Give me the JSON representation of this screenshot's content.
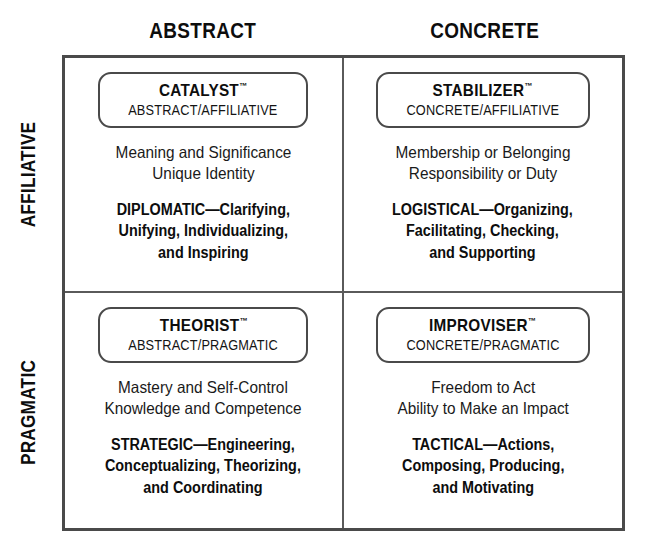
{
  "columns": [
    {
      "label": "ABSTRACT"
    },
    {
      "label": "CONCRETE"
    }
  ],
  "rows": [
    {
      "label": "AFFILIATIVE"
    },
    {
      "label": "PRAGMATIC"
    }
  ],
  "quadrants": [
    {
      "title": "CATALYST",
      "trademark": "™",
      "subtitle": "ABSTRACT/AFFILIATIVE",
      "values": [
        "Meaning and Significance",
        "Unique Identity"
      ],
      "roles": [
        "DIPLOMATIC—Clarifying,",
        "Unifying, Individualizing,",
        "and Inspiring"
      ]
    },
    {
      "title": "STABILIZER",
      "trademark": "™",
      "subtitle": "CONCRETE/AFFILIATIVE",
      "values": [
        "Membership or Belonging",
        "Responsibility or Duty"
      ],
      "roles": [
        "LOGISTICAL—Organizing,",
        "Facilitating, Checking,",
        "and Supporting"
      ]
    },
    {
      "title": "THEORIST",
      "trademark": "™",
      "subtitle": "ABSTRACT/PRAGMATIC",
      "values": [
        "Mastery and Self-Control",
        "Knowledge and Competence"
      ],
      "roles": [
        "STRATEGIC—Engineering,",
        "Conceptualizing, Theorizing,",
        "and Coordinating"
      ]
    },
    {
      "title": "IMPROVISER",
      "trademark": "™",
      "subtitle": "CONCRETE/PRAGMATIC",
      "values": [
        "Freedom to Act",
        "Ability to Make an Impact"
      ],
      "roles": [
        "TACTICAL—Actions,",
        "Composing, Producing,",
        "and Motivating"
      ]
    }
  ],
  "colors": {
    "outer_border": "#4a4a4a",
    "inner_divider": "#5a5a5a",
    "text": "#111111",
    "background": "#ffffff"
  }
}
